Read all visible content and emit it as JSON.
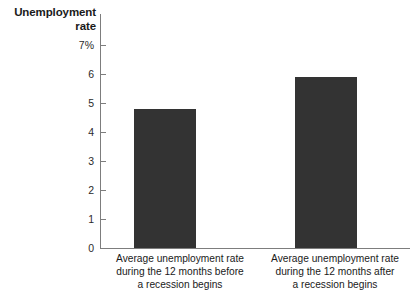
{
  "chart_data": {
    "type": "bar",
    "title": "",
    "ylabel": "Unemployment\nrate",
    "xlabel": "",
    "ylim": [
      0,
      7
    ],
    "grid": false,
    "legend": null,
    "categories": [
      "Average unemployment rate\nduring the 12 months before\na recession begins",
      "Average unemployment rate\nduring the 12 months after\na recession begins"
    ],
    "values": [
      4.8,
      5.9
    ],
    "y_ticks": [
      {
        "value": 7,
        "label": "7%"
      },
      {
        "value": 6,
        "label": "6"
      },
      {
        "value": 5,
        "label": "5"
      },
      {
        "value": 4,
        "label": "4"
      },
      {
        "value": 3,
        "label": "3"
      },
      {
        "value": 2,
        "label": "2"
      },
      {
        "value": 1,
        "label": "1"
      },
      {
        "value": 0,
        "label": "0"
      }
    ],
    "colors": {
      "bar": "#333333",
      "axis": "#7d7d7d",
      "text": "#1a1a1a",
      "background": "#ffffff"
    }
  }
}
